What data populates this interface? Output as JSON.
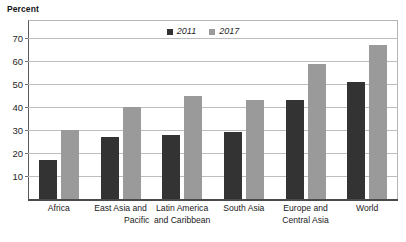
{
  "chart_data": {
    "type": "bar",
    "title": "Percent",
    "xlabel": "",
    "ylabel": "Percent",
    "ylim": [
      0,
      78
    ],
    "ytick_step": 10,
    "yticks": [
      10,
      20,
      30,
      40,
      50,
      60,
      70
    ],
    "grid": true,
    "legend_position": "top-center",
    "categories": [
      "Africa",
      "East Asia and Pacific",
      "Latin America and Caribbean",
      "South Asia",
      "Europe and Central Asia",
      "World"
    ],
    "category_lines": [
      [
        "Africa",
        ""
      ],
      [
        "East Asia and",
        "Pacific"
      ],
      [
        "Latin America",
        "and Caribbean"
      ],
      [
        "South Asia",
        ""
      ],
      [
        "Europe and",
        "Central Asia"
      ],
      [
        "World",
        ""
      ]
    ],
    "series": [
      {
        "name": "2011",
        "color": "#333333",
        "values": [
          17,
          27,
          28,
          29,
          43,
          51
        ]
      },
      {
        "name": "2017",
        "color": "#9a9a9a",
        "values": [
          30,
          40,
          45,
          43,
          59,
          67
        ]
      }
    ]
  },
  "legend": {
    "items": [
      {
        "label": "2011",
        "color": "#333333"
      },
      {
        "label": "2017",
        "color": "#9a9a9a"
      }
    ]
  },
  "axis": {
    "title": "Percent",
    "tick_labels": [
      "70",
      "60",
      "50",
      "40",
      "30",
      "20",
      "10"
    ]
  }
}
